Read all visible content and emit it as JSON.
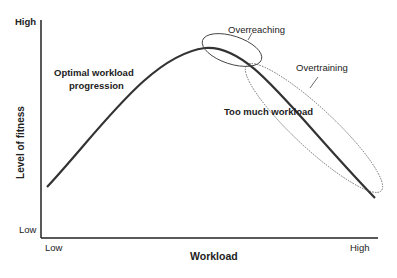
{
  "diagram": {
    "y_axis": {
      "label": "Level of fitness",
      "high": "High",
      "low": "Low"
    },
    "x_axis": {
      "label": "Workload",
      "low": "Low",
      "high": "High"
    },
    "annotations": {
      "optimal_line1": "Optimal workload",
      "optimal_line2": "progression",
      "overreaching": "Overreaching",
      "overtraining": "Overtraining",
      "too_much": "Too much workload"
    },
    "colors": {
      "curve": "#333333",
      "axis": "#222222",
      "ellipse": "#555555"
    }
  }
}
